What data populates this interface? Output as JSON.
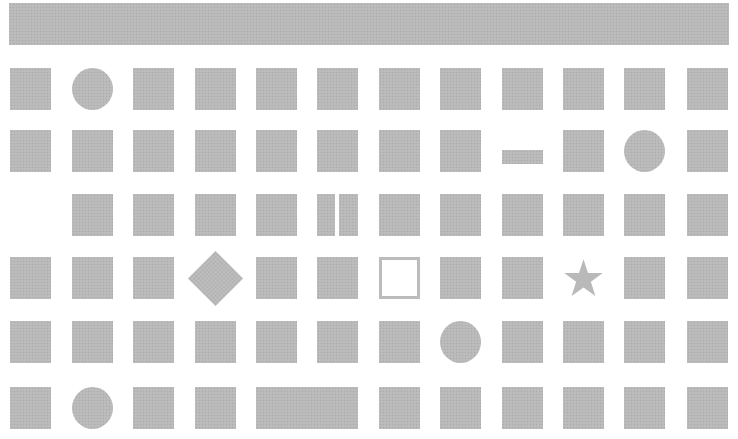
{
  "colors": {
    "shape_fill": "#b9b9b9",
    "background": "#ffffff",
    "hollow_border": "#bcbcbc"
  },
  "layout": {
    "top_bar": {
      "x": 9,
      "y": 3,
      "w": 720,
      "h": 42
    },
    "columns_x": [
      10,
      72,
      133,
      195,
      256,
      317,
      379,
      440,
      502,
      563,
      624,
      687
    ],
    "rows_y": [
      68,
      130,
      194,
      257,
      321,
      387
    ],
    "cell_w": 41,
    "cell_h": 42
  },
  "grid": [
    [
      "square",
      "circle",
      "square",
      "square",
      "square",
      "square",
      "square",
      "square",
      "square",
      "square",
      "square",
      "square"
    ],
    [
      "square",
      "square",
      "square",
      "square",
      "square",
      "square",
      "square",
      "square",
      "bar",
      "square",
      "circle",
      "square"
    ],
    [
      "empty",
      "square",
      "square",
      "square",
      "square",
      "split",
      "square",
      "square",
      "square",
      "square",
      "square",
      "square"
    ],
    [
      "square",
      "square",
      "square",
      "diamond",
      "square",
      "square",
      "hollow",
      "square",
      "square",
      "star",
      "square",
      "square"
    ],
    [
      "square",
      "square",
      "square",
      "square",
      "square",
      "square",
      "square",
      "circle",
      "square",
      "square",
      "square",
      "square"
    ],
    [
      "square",
      "circle",
      "square",
      "square",
      "wide-start",
      "wide-cont",
      "square",
      "square",
      "square",
      "square",
      "square",
      "square"
    ]
  ]
}
